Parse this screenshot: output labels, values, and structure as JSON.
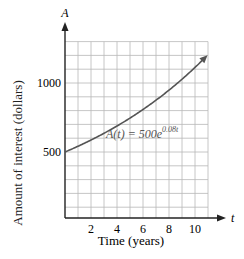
{
  "chart_data": {
    "type": "line",
    "title": "",
    "xlabel": "Time (years)",
    "ylabel": "Amount of interest (dollars)",
    "x_axis_symbol": "t",
    "y_axis_symbol": "A",
    "xlim": [
      0,
      11
    ],
    "ylim": [
      0,
      1300
    ],
    "x_ticks": [
      2,
      4,
      6,
      8,
      10
    ],
    "y_ticks": [
      500,
      1000
    ],
    "x_grid_step": 1,
    "y_grid_step": 100,
    "grid": true,
    "legend": null,
    "annotations": [
      {
        "text": "A(t) = 500e^(0.08t)",
        "formula": "A(t) = 500e",
        "exponent": "0.08t",
        "x": 5.3,
        "y": 700
      }
    ],
    "series": [
      {
        "name": "A(t) = 500e^(0.08t)",
        "x": [
          0,
          1,
          2,
          3,
          4,
          5,
          6,
          7,
          8,
          9,
          10,
          11
        ],
        "values": [
          500,
          541.6,
          586.8,
          635.6,
          688.6,
          745.9,
          808.0,
          875.4,
          948.3,
          1027.2,
          1112.8,
          1205.5
        ],
        "arrow_end": true
      }
    ]
  },
  "labels": {
    "y_symbol": "A",
    "x_symbol": "t",
    "ylabel": "Amount of interest (dollars)",
    "xlabel": "Time (years)",
    "tick_x": [
      "2",
      "4",
      "6",
      "8",
      "10"
    ],
    "tick_y": [
      "500",
      "1000"
    ],
    "formula_main": "A(t) = 500e",
    "formula_exp": "0.08t"
  },
  "colors": {
    "grid": "#b8b8b8",
    "axis": "#222222",
    "curve": "#555555",
    "text": "#222222"
  }
}
